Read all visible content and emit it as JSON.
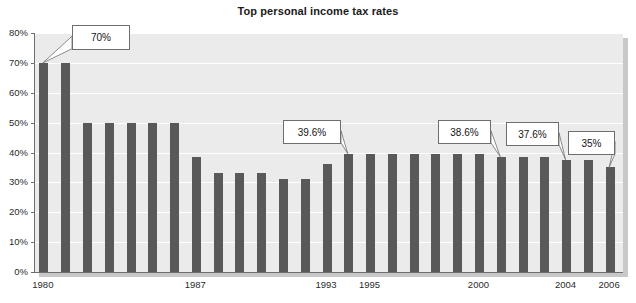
{
  "chart_data": {
    "type": "bar",
    "title": "Top personal income tax rates",
    "xlabel": "",
    "ylabel": "",
    "ylim": [
      0,
      80
    ],
    "ytick_labels": [
      "0%",
      "10%",
      "20%",
      "30%",
      "40%",
      "50%",
      "60%",
      "70%",
      "80%"
    ],
    "ytick_values": [
      0,
      10,
      20,
      30,
      40,
      50,
      60,
      70,
      80
    ],
    "grid": true,
    "legend": "none",
    "bar_color": "#595959",
    "plot_background": "#ebebeb",
    "categories": [
      "1980",
      "1981",
      "1982",
      "1983",
      "1984",
      "1985",
      "1986",
      "1987",
      "1988",
      "1989",
      "1990",
      "1991",
      "1992",
      "1993",
      "1994",
      "1995",
      "1996",
      "1997",
      "1998",
      "1999",
      "2000",
      "2001",
      "2002",
      "2003",
      "2004",
      "2005",
      "2006"
    ],
    "values": [
      70,
      70,
      50,
      50,
      50,
      50,
      50,
      38.5,
      33,
      33,
      33,
      31,
      31,
      36,
      39.6,
      39.6,
      39.6,
      39.6,
      39.6,
      39.6,
      39.6,
      38.6,
      38.6,
      38.6,
      37.6,
      37.6,
      35
    ],
    "xtick_labels": [
      "1980",
      "1987",
      "1993",
      "1995",
      "2000",
      "2004",
      "2006"
    ],
    "xtick_categories": [
      "1980",
      "1987",
      "1993",
      "1995",
      "2000",
      "2004",
      "2006"
    ],
    "annotations": [
      {
        "label": "70%",
        "value": 70,
        "category": "1980"
      },
      {
        "label": "39.6%",
        "value": 39.6,
        "category": "1994"
      },
      {
        "label": "38.6%",
        "value": 38.6,
        "category": "2001"
      },
      {
        "label": "37.6%",
        "value": 37.6,
        "category": "2004"
      },
      {
        "label": "35%",
        "value": 35,
        "category": "2006"
      }
    ]
  }
}
